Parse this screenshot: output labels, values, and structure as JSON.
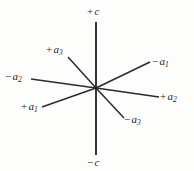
{
  "figure": {
    "kind": "crystallographic-axes-diagram",
    "system": "hexagonal",
    "width": 194,
    "height": 171,
    "background_color": "#fdfdfc",
    "line_color": "#2b2b2b",
    "text_color": "#1a1a1a",
    "origin": {
      "x": 96,
      "y": 88
    }
  },
  "axes": [
    {
      "id": "c-positive",
      "sign": "+",
      "symbol": "c",
      "subscript": "",
      "label_text": "+c",
      "x1": 96,
      "y1": 88,
      "x2": 96,
      "y2": 22,
      "label_x": 87,
      "label_y": 6,
      "stroke_width": 1.9
    },
    {
      "id": "c-negative",
      "sign": "−",
      "symbol": "c",
      "subscript": "",
      "label_text": "−c",
      "x1": 96,
      "y1": 88,
      "x2": 96,
      "y2": 155,
      "label_x": 87,
      "label_y": 157,
      "stroke_width": 1.9
    },
    {
      "id": "a1-positive",
      "sign": "+",
      "symbol": "a",
      "subscript": "1",
      "label_text": "+a₁",
      "x1": 96,
      "y1": 88,
      "x2": 42,
      "y2": 107,
      "label_x": 21,
      "label_y": 101,
      "stroke_width": 1.5
    },
    {
      "id": "a1-negative",
      "sign": "−",
      "symbol": "a",
      "subscript": "1",
      "label_text": "−a₁",
      "x1": 96,
      "y1": 88,
      "x2": 150,
      "y2": 62,
      "label_x": 152,
      "label_y": 56,
      "stroke_width": 1.5
    },
    {
      "id": "a2-positive",
      "sign": "+",
      "symbol": "a",
      "subscript": "2",
      "label_text": "+a₂",
      "x1": 96,
      "y1": 88,
      "x2": 159,
      "y2": 97,
      "label_x": 160,
      "label_y": 91,
      "stroke_width": 1.5
    },
    {
      "id": "a2-negative",
      "sign": "−",
      "symbol": "a",
      "subscript": "2",
      "label_text": "−a₂",
      "x1": 96,
      "y1": 88,
      "x2": 31,
      "y2": 79,
      "label_x": 5,
      "label_y": 71,
      "stroke_width": 1.5
    },
    {
      "id": "a3-positive",
      "sign": "+",
      "symbol": "a",
      "subscript": "3",
      "label_text": "+a₃",
      "x1": 96,
      "y1": 88,
      "x2": 68,
      "y2": 57,
      "label_x": 46,
      "label_y": 44,
      "stroke_width": 1.5
    },
    {
      "id": "a3-negative",
      "sign": "−",
      "symbol": "a",
      "subscript": "3",
      "label_text": "−a₃",
      "x1": 96,
      "y1": 88,
      "x2": 124,
      "y2": 118,
      "label_x": 124,
      "label_y": 114,
      "stroke_width": 1.5
    }
  ]
}
